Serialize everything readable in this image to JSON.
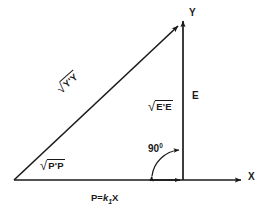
{
  "figure": {
    "background_color": "#ffffff",
    "stroke_color": "#1a1a1a",
    "width": 265,
    "height": 217
  },
  "axes": {
    "y_label": "Y",
    "x_label": "X"
  },
  "labels": {
    "e_segment": "E",
    "sqrt_ee_sign": "√",
    "sqrt_ee_body": "E'E",
    "sqrt_pp_sign": "√",
    "sqrt_pp_body": "P'P",
    "sqrt_yy_sign": "√",
    "sqrt_yy_body": "Y'Y",
    "angle_value": "90",
    "angle_degree_symbol": "0",
    "projection_equation_lhs": "P=",
    "projection_equation_k": "k",
    "projection_equation_subscript": "1",
    "projection_equation_rhs": "X"
  },
  "geometry": {
    "origin": {
      "x": 14,
      "y": 180
    },
    "vertical_axis_x": 183,
    "apex": {
      "x": 183,
      "y": 22
    },
    "x_axis_end": {
      "x": 243,
      "y": 180
    },
    "y_axis_top": {
      "y": 18
    },
    "hypotenuse_arrow_tip": {
      "x": 180,
      "y": 24
    },
    "angle_arc_radius": 30
  }
}
